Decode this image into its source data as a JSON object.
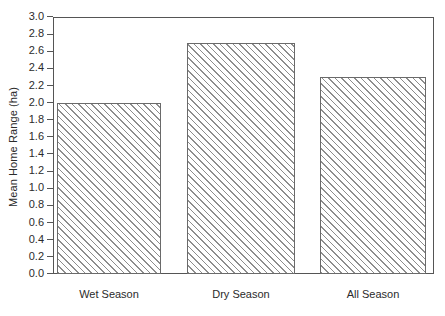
{
  "chart_data": {
    "type": "bar",
    "title": "",
    "xlabel": "",
    "ylabel": "Mean Home Range (ha)",
    "categories": [
      "Wet Season",
      "Dry Season",
      "All Season"
    ],
    "values": [
      2.0,
      2.7,
      2.3
    ],
    "ylim": [
      0.0,
      3.0
    ],
    "ytick_step": 0.2,
    "yticks": [
      "3.0",
      "2.8",
      "2.6",
      "2.4",
      "2.2",
      "2.0",
      "1.8",
      "1.6",
      "1.4",
      "1.2",
      "1.0",
      "0.8",
      "0.6",
      "0.4",
      "0.2",
      "0.0"
    ],
    "ytick_values": [
      3.0,
      2.8,
      2.6,
      2.4,
      2.2,
      2.0,
      1.8,
      1.6,
      1.4,
      1.2,
      1.0,
      0.8,
      0.6,
      0.4,
      0.2,
      0.0
    ],
    "grid": false,
    "legend": false,
    "legend_position": "none",
    "bar_fill": "hatched-diagonal",
    "colors": {
      "bar_edge": "#6a6a6a",
      "bar_hatch": "#8d8d8d",
      "axis": "#555555",
      "text": "#2b2b2b",
      "background": "#ffffff"
    }
  }
}
